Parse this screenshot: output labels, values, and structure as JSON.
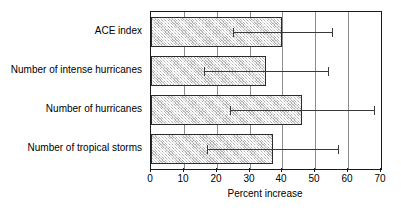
{
  "chart_data": {
    "type": "bar",
    "orientation": "horizontal",
    "title": "",
    "xlabel": "Percent increase",
    "ylabel": "",
    "xlim": [
      0,
      70
    ],
    "ylim": null,
    "xticks": [
      0,
      10,
      20,
      30,
      40,
      50,
      60,
      70
    ],
    "xticklabels": [
      "0",
      "10",
      "20",
      "30",
      "40",
      "50",
      "60",
      "70"
    ],
    "grid": "vertical gridlines at each x tick",
    "legend": null,
    "categories": [
      "ACE index",
      "Number of intense hurricanes",
      "Number of hurricanes",
      "Number of tropical storms"
    ],
    "values": [
      40,
      35,
      46,
      37
    ],
    "error_low": [
      25,
      16,
      24,
      17
    ],
    "error_high": [
      55,
      54,
      68,
      57
    ],
    "series": [
      {
        "name": "Percent increase",
        "values": [
          40,
          35,
          46,
          37
        ],
        "error_low": [
          25,
          16,
          24,
          17
        ],
        "error_high": [
          55,
          54,
          68,
          57
        ]
      }
    ],
    "bar_fill": "#b0b0b0",
    "bar_edge": "#2b2b2b",
    "error_color": "#3a3a3a",
    "axis_color": "#1a1a1a",
    "grid_color": "#8c8c8c"
  }
}
